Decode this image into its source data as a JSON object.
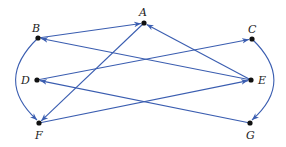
{
  "diagram": {
    "type": "directed-graph",
    "edge_color": "#3a5db0",
    "node_color": "#111111",
    "nodes": [
      {
        "id": "A",
        "label": "A",
        "x": 144,
        "y": 23,
        "lx": 139,
        "ly": 7
      },
      {
        "id": "B",
        "label": "B",
        "x": 38,
        "y": 38,
        "lx": 32,
        "ly": 23
      },
      {
        "id": "C",
        "label": "C",
        "x": 252,
        "y": 39,
        "lx": 248,
        "ly": 24
      },
      {
        "id": "D",
        "label": "D",
        "x": 37,
        "y": 80,
        "lx": 21,
        "ly": 75
      },
      {
        "id": "E",
        "label": "E",
        "x": 251,
        "y": 80,
        "lx": 258,
        "ly": 75
      },
      {
        "id": "F",
        "label": "F",
        "x": 39,
        "y": 123,
        "lx": 35,
        "ly": 130
      },
      {
        "id": "G",
        "label": "G",
        "x": 250,
        "y": 123,
        "lx": 246,
        "ly": 130
      }
    ],
    "edges": [
      {
        "from": "B",
        "to": "A",
        "curved": false
      },
      {
        "from": "E",
        "to": "A",
        "curved": false
      },
      {
        "from": "E",
        "to": "B",
        "curved": false
      },
      {
        "from": "A",
        "to": "F",
        "curved": false
      },
      {
        "from": "B",
        "to": "F",
        "curved": true,
        "side": "left"
      },
      {
        "from": "D",
        "to": "C",
        "curved": false
      },
      {
        "from": "G",
        "to": "D",
        "curved": false
      },
      {
        "from": "F",
        "to": "E",
        "curved": false
      },
      {
        "from": "C",
        "to": "G",
        "curved": true,
        "side": "right"
      }
    ]
  }
}
